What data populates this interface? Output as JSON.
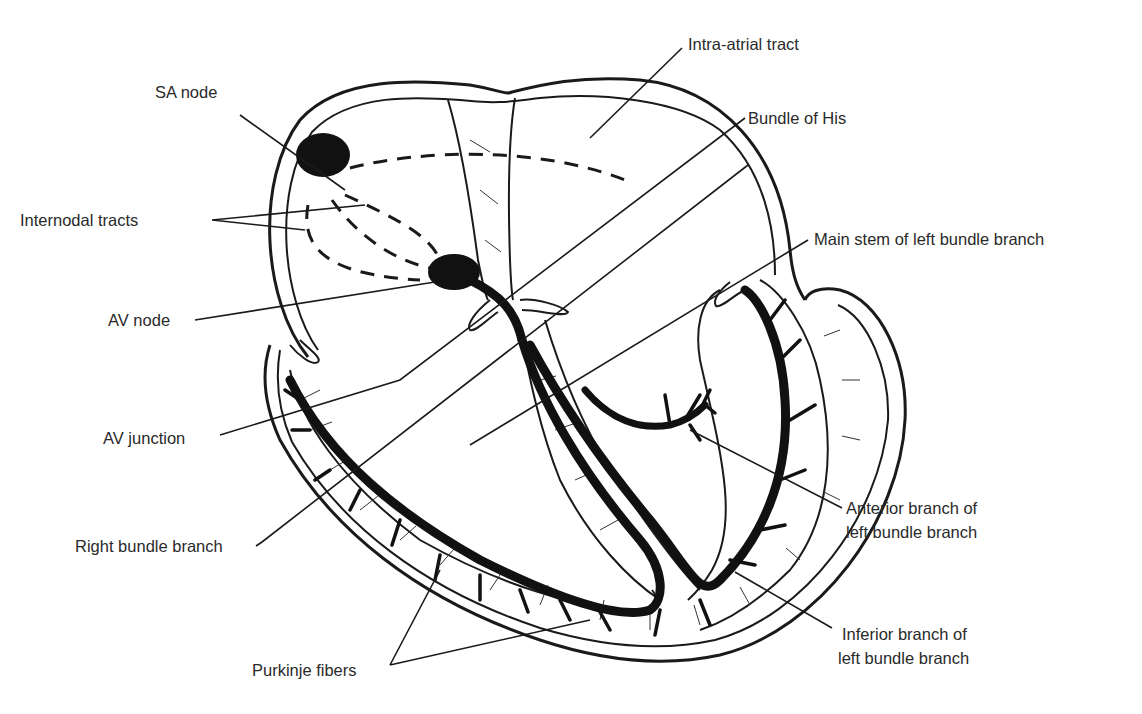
{
  "labels": {
    "sa_node": "SA node",
    "intra_atrial_tract": "Intra-atrial tract",
    "bundle_of_his": "Bundle of His",
    "internodal_tracts": "Internodal tracts",
    "main_stem_lbb": "Main stem of left bundle branch",
    "av_node": "AV node",
    "av_junction": "AV junction",
    "anterior_branch_line1": "Anterior branch of",
    "anterior_branch_line2": "left bundle branch",
    "right_bundle_branch": "Right bundle branch",
    "inferior_branch_line1": "Inferior branch of",
    "inferior_branch_line2": "left bundle branch",
    "purkinje_fibers": "Purkinje fibers"
  },
  "colors": {
    "line": "#1a1a1a",
    "text": "#2a2a2a",
    "background": "#ffffff"
  }
}
